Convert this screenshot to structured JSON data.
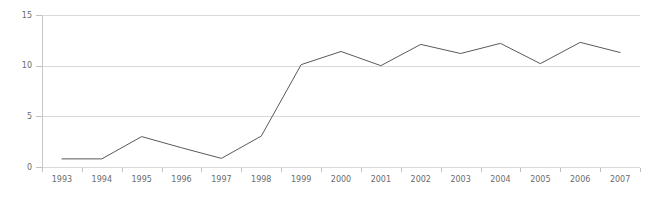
{
  "chart_data": {
    "type": "line",
    "title": "",
    "subtitle": "",
    "xlabel": "",
    "ylabel": "",
    "categories": [
      "1993",
      "1994",
      "1995",
      "1996",
      "1997",
      "1998",
      "1999",
      "2000",
      "2001",
      "2002",
      "2003",
      "2004",
      "2005",
      "2006",
      "2007"
    ],
    "values": [
      0.8,
      0.8,
      3.0,
      1.9,
      0.85,
      3.05,
      10.1,
      11.4,
      10.0,
      12.1,
      11.2,
      12.2,
      10.2,
      12.3,
      11.3
    ],
    "series": [
      {
        "name": "",
        "values": [
          0.8,
          0.8,
          3.0,
          1.9,
          0.85,
          3.05,
          10.1,
          11.4,
          10.0,
          12.1,
          11.2,
          12.2,
          10.2,
          12.3,
          11.3
        ]
      }
    ],
    "ylim": [
      0,
      15
    ],
    "yticks": [
      0,
      5,
      10,
      15
    ],
    "ytick_labels": [
      "0",
      "5",
      "10",
      "15"
    ],
    "xtick_labels": [
      "1993",
      "1994",
      "1995",
      "1996",
      "1997",
      "1998",
      "1999",
      "2000",
      "2001",
      "2002",
      "2003",
      "2004",
      "2005",
      "2006",
      "2007"
    ],
    "grid": true,
    "grid_axis": "y",
    "legend": false,
    "legend_position": "none",
    "colors": {
      "line": "#5a5a5a",
      "grid": "#d9d9d9",
      "axis": "#c8c8c8",
      "tick_label": "#6b6b6b",
      "background": "#ffffff"
    }
  },
  "layout": {
    "plot_left": 42,
    "plot_right": 640,
    "plot_top": 15,
    "plot_bottom": 167,
    "width": 653,
    "height": 197
  }
}
